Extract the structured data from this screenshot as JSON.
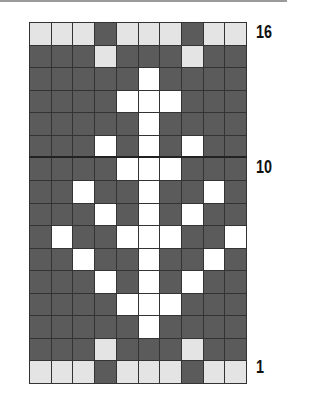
{
  "chart": {
    "columns": 10,
    "rows": 16,
    "colors": {
      "dark": "#5b5b5b",
      "white": "#ffffff",
      "light": "#e4e4e4"
    },
    "row_labels": [
      {
        "text": "16",
        "row_from_top": 1
      },
      {
        "text": "10",
        "row_from_top": 7
      },
      {
        "text": "1",
        "row_from_top": 16
      }
    ],
    "legend": "Each row top-to-bottom; D=dark, W=white, L=light gray",
    "pattern": [
      "LLLDLLLDLL",
      "DDDLDDDLDD",
      "DDDDDWDDDD",
      "DDDDWWWDDD",
      "DDDDDWDDDD",
      "DDDWDWDWDD",
      "DDDDWWWDDD",
      "DDWDDWDDWD",
      "DDDWDWDWDD",
      "DWDDWWWDDW",
      "DDWDDWDDWD",
      "DDDWDWDWDD",
      "DDDDWWWDDD",
      "DDDDDWDDDD",
      "DDDLDDDLDD",
      "LLLDLLLDLL"
    ]
  },
  "labels": {
    "top": "16",
    "mid": "10",
    "bottom": "1"
  }
}
